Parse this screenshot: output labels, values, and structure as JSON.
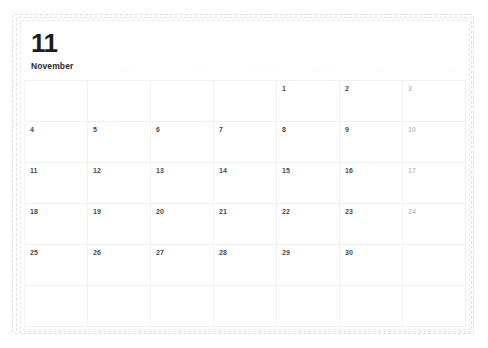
{
  "calendar": {
    "month_number": "11",
    "month_name": "November",
    "weekday_headers": [
      {
        "label": "Sunday",
        "key": "sun"
      },
      {
        "label": "Monday",
        "key": "mon"
      },
      {
        "label": "Tuesday",
        "key": "tue"
      },
      {
        "label": "Wednesday",
        "key": "wed"
      },
      {
        "label": "Thursday",
        "key": "thu"
      },
      {
        "label": "Friday",
        "key": "fri"
      },
      {
        "label": "Saturday",
        "key": "sat"
      }
    ],
    "weeks": [
      [
        "",
        "",
        "",
        "",
        "1",
        "2",
        "3"
      ],
      [
        "4",
        "5",
        "6",
        "7",
        "8",
        "9",
        "10"
      ],
      [
        "11",
        "12",
        "13",
        "14",
        "15",
        "16",
        "17"
      ],
      [
        "18",
        "19",
        "20",
        "21",
        "22",
        "23",
        "24"
      ],
      [
        "25",
        "26",
        "27",
        "28",
        "29",
        "30",
        ""
      ],
      [
        "",
        "",
        "",
        "",
        "",
        "",
        ""
      ]
    ],
    "weekend_column_index": 6,
    "colors": {
      "month_number": "#1c1c1c",
      "month_name": "#2b2b2b",
      "weekday_header": "#fbfbfb",
      "day_number": "#4a4a4a",
      "weekend_day_number": "#c3c3c3",
      "grid_line": "#f0f0f0",
      "sheet_border": "#dcdcdc",
      "background": "#ffffff"
    }
  }
}
